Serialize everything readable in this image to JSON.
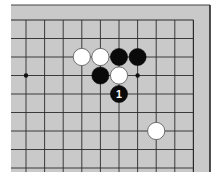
{
  "board": {
    "background": "#c9c9c9",
    "line_color": "#2a2a2a",
    "edge_color": "#1a1a1a",
    "origin_x": 26,
    "origin_y": 20,
    "spacing_x": 18.6,
    "spacing_y": 18.5,
    "cols": 10,
    "rows": 9,
    "stone_radius": 8.6
  },
  "star_points": [
    {
      "col": 0,
      "row": 3
    },
    {
      "col": 6,
      "row": 3
    }
  ],
  "stones": [
    {
      "col": 3,
      "row": 2,
      "color": "white",
      "label": ""
    },
    {
      "col": 4,
      "row": 2,
      "color": "white",
      "label": ""
    },
    {
      "col": 5,
      "row": 2,
      "color": "black",
      "label": ""
    },
    {
      "col": 6,
      "row": 2,
      "color": "black",
      "label": ""
    },
    {
      "col": 4,
      "row": 3,
      "color": "black",
      "label": ""
    },
    {
      "col": 5,
      "row": 3,
      "color": "white",
      "label": ""
    },
    {
      "col": 5,
      "row": 4,
      "color": "black",
      "label": "1"
    },
    {
      "col": 7,
      "row": 6,
      "color": "white",
      "label": ""
    }
  ]
}
